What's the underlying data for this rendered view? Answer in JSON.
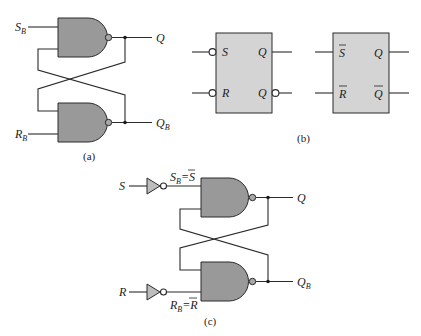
{
  "figure": {
    "parts": [
      {
        "id": "a",
        "caption": "(a)",
        "description": "Cross-coupled NAND latch"
      },
      {
        "id": "b",
        "caption": "(b)",
        "description": "Block symbols for SR latch with active-low inputs"
      },
      {
        "id": "c",
        "caption": "(c)",
        "description": "NAND latch with input inverters"
      }
    ]
  },
  "part_a": {
    "caption": "(a)",
    "inputs": {
      "top": {
        "main": "S",
        "sub": "B"
      },
      "bottom": {
        "main": "R",
        "sub": "B"
      }
    },
    "outputs": {
      "top": {
        "main": "Q",
        "sub": ""
      },
      "bottom": {
        "main": "Q",
        "sub": "B"
      }
    }
  },
  "part_b": {
    "caption": "(b)",
    "block1": {
      "in_top": "S",
      "in_bottom": "R",
      "out_top": "Q",
      "out_bottom": "Q"
    },
    "block2": {
      "in_top": "S",
      "in_bottom": "R",
      "out_top": "Q",
      "out_bottom": "Q"
    }
  },
  "part_c": {
    "caption": "(c)",
    "inputs": {
      "top": "S",
      "bottom": "R"
    },
    "inverter_labels": {
      "top": {
        "main": "S",
        "sub": "B",
        "eq": "=",
        "rhs": "S"
      },
      "bottom": {
        "main": "R",
        "sub": "B",
        "eq": "=",
        "rhs": "R"
      }
    },
    "outputs": {
      "top": {
        "main": "Q",
        "sub": ""
      },
      "bottom": {
        "main": "Q",
        "sub": "B"
      }
    }
  }
}
